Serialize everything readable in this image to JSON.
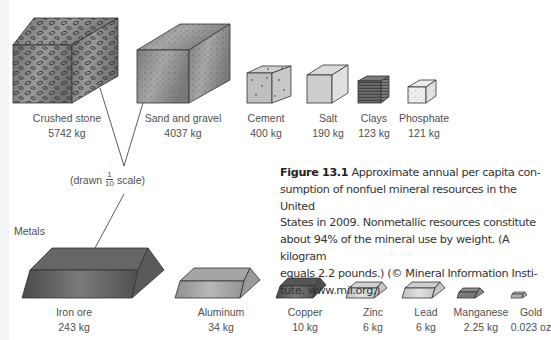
{
  "figure": {
    "number": "Figure 13.1",
    "caption": "Approximate annual per capita consumption of nonfuel mineral resources in the United States in 2009. Nonmetallic resources constitute about 94% of the mineral use by weight. (A kilogram equals 2.2 pounds.) (© Mineral Information Institute. www.mii.org.)",
    "caption_lines": [
      "Approximate annual per capita con-",
      "sumption of nonfuel mineral resources in the United",
      "States in 2009. Nonmetallic resources constitute",
      "about 94% of the mineral use by weight. (A kilogram",
      "equals 2.2 pounds.) (© Mineral Information Insti-",
      "tute. www.mii.org.)"
    ]
  },
  "scale_note": {
    "prefix": "(drawn",
    "numerator": "1",
    "denominator": "10",
    "suffix": "scale)"
  },
  "metals_heading": "Metals",
  "nonmetals": [
    {
      "name": "Crushed stone",
      "amount": "5742 kg"
    },
    {
      "name": "Sand and gravel",
      "amount": "4037 kg"
    },
    {
      "name": "Cement",
      "amount": "400 kg"
    },
    {
      "name": "Salt",
      "amount": "190 kg"
    },
    {
      "name": "Clays",
      "amount": "123 kg"
    },
    {
      "name": "Phosphate",
      "amount": "121 kg"
    }
  ],
  "metals": [
    {
      "name": "Iron ore",
      "amount": "243 kg"
    },
    {
      "name": "Aluminum",
      "amount": "34 kg"
    },
    {
      "name": "Copper",
      "amount": "10 kg"
    },
    {
      "name": "Zinc",
      "amount": "6 kg"
    },
    {
      "name": "Lead",
      "amount": "6 kg"
    },
    {
      "name": "Manganese",
      "amount": "2.25 kg"
    },
    {
      "name": "Gold",
      "amount": "0.023 oz"
    }
  ]
}
